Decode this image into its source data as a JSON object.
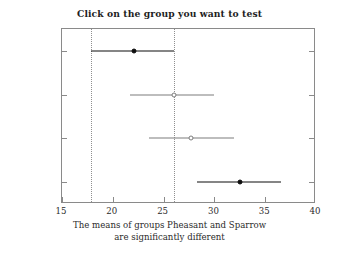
{
  "chart_data": {
    "type": "scatter",
    "title": "Click on the group you want to test",
    "subtitle_lines": [
      "The means of groups Pheasant and Sparrow",
      "are significantly different"
    ],
    "xlabel": "",
    "ylabel": "",
    "xlim": [
      15,
      40
    ],
    "xticks": [
      15,
      20,
      25,
      30,
      35,
      40
    ],
    "xticklabels": [
      "15",
      "20",
      "25",
      "30",
      "35",
      "40"
    ],
    "grid": false,
    "legend": null,
    "categories": [
      "Pheasant",
      "Bobwhite",
      "Red-wing",
      "Sparrow"
    ],
    "series": [
      {
        "name": "group means with comparison intervals",
        "points": [
          {
            "group": "Pheasant",
            "mean": 22.1,
            "lower": 17.9,
            "upper": 26.0,
            "marker": "filled",
            "color": "#0d0d0d",
            "selected": true
          },
          {
            "group": "Bobwhite",
            "mean": 26.0,
            "lower": 21.7,
            "upper": 30.0,
            "marker": "open",
            "color": "#7d7d7d",
            "selected": false
          },
          {
            "group": "Red-wing",
            "mean": 27.7,
            "lower": 23.6,
            "upper": 31.9,
            "marker": "open",
            "color": "#7d7d7d",
            "selected": false
          },
          {
            "group": "Sparrow",
            "mean": 32.5,
            "lower": 28.3,
            "upper": 36.6,
            "marker": "filled",
            "color": "#0d0d0d",
            "selected": true
          }
        ]
      }
    ],
    "reference_lines": [
      {
        "name": "selected-interval-lower",
        "x": 17.9,
        "style": "dotted",
        "color": "#8f8f8f"
      },
      {
        "name": "selected-interval-upper",
        "x": 26.0,
        "style": "dotted",
        "color": "#8f8f8f"
      }
    ],
    "colors": {
      "axis": "#8a8a8a",
      "text": "#2b2b2b",
      "highlight": "#0d0d0d",
      "muted": "#7d7d7d",
      "background": "#ffffff"
    }
  }
}
